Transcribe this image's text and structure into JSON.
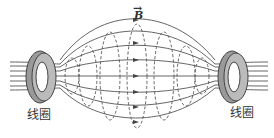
{
  "diagram": {
    "left_coil_label": "线圈",
    "right_coil_label": "线圈",
    "field_label": "B",
    "field_label_vector": "→"
  },
  "colors": {
    "line": "#444444",
    "coil_fill": "#aaaaaa",
    "coil_dark": "#666666"
  }
}
